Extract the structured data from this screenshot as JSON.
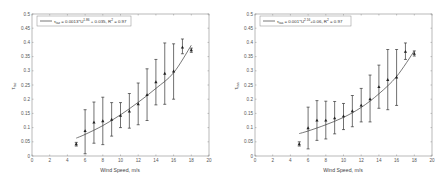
{
  "chart_data": [
    {
      "type": "scatter",
      "panel": "left",
      "title": "",
      "xlabel": "Wind Speed, m/s",
      "ylabel": "τ_taz",
      "xlim": [
        0,
        20
      ],
      "ylim": [
        0,
        0.5
      ],
      "xticks": [
        0,
        2,
        4,
        6,
        8,
        10,
        12,
        14,
        16,
        18,
        20
      ],
      "yticks": [
        0,
        0.05,
        0.1,
        0.15,
        0.2,
        0.25,
        0.3,
        0.35,
        0.4,
        0.45,
        0.5
      ],
      "xtick_labels": [
        "0",
        "2",
        "4",
        "6",
        "8",
        "10",
        "12",
        "14",
        "16",
        "18",
        "20"
      ],
      "ytick_labels": [
        "0",
        "0.05",
        "0.1",
        "0.15",
        "0.2",
        "0.25",
        "0.3",
        "0.35",
        "0.4",
        "0.45",
        "0.5"
      ],
      "grid": false,
      "legend": {
        "position": "upper left",
        "entries": [
          "τ_taz = 0.0013*U^1.86 + 0.035, R² = 0.97"
        ]
      },
      "series": [
        {
          "name": "observed (mean ± std)",
          "marker": "triangle",
          "x": [
            5,
            6,
            7,
            8,
            9,
            10,
            11,
            12,
            13,
            14,
            15,
            16,
            17,
            18
          ],
          "y": [
            0.042,
            0.088,
            0.118,
            0.123,
            0.128,
            0.142,
            0.157,
            0.183,
            0.215,
            0.26,
            0.29,
            0.298,
            0.382,
            0.373
          ],
          "err_low": [
            0.035,
            0.008,
            0.045,
            0.04,
            0.07,
            0.1,
            0.098,
            0.11,
            0.125,
            0.18,
            0.182,
            0.2,
            0.36,
            0.365
          ],
          "err_high": [
            0.048,
            0.163,
            0.19,
            0.207,
            0.188,
            0.188,
            0.22,
            0.257,
            0.307,
            0.34,
            0.398,
            0.395,
            0.412,
            0.38
          ]
        },
        {
          "name": "fit",
          "type": "line",
          "x": [
            5,
            6,
            8,
            10,
            12,
            14,
            16,
            18
          ],
          "y": [
            0.063,
            0.076,
            0.107,
            0.145,
            0.189,
            0.238,
            0.293,
            0.39
          ]
        }
      ]
    },
    {
      "type": "scatter",
      "panel": "right",
      "title": "",
      "xlabel": "Wind Speed, m/s",
      "ylabel": "τ_taa",
      "xlim": [
        0,
        20
      ],
      "ylim": [
        0,
        0.5
      ],
      "xticks": [
        0,
        2,
        4,
        6,
        8,
        10,
        12,
        14,
        16,
        18,
        20
      ],
      "yticks": [
        0,
        0.05,
        0.1,
        0.15,
        0.2,
        0.25,
        0.3,
        0.35,
        0.4,
        0.45,
        0.5
      ],
      "xtick_labels": [
        "0",
        "2",
        "4",
        "6",
        "8",
        "10",
        "12",
        "14",
        "16",
        "18",
        "20"
      ],
      "ytick_labels": [
        "0",
        "0.05",
        "0.1",
        "0.15",
        "0.2",
        "0.25",
        "0.3",
        "0.35",
        "0.4",
        "0.45",
        "0.5"
      ],
      "grid": false,
      "legend": {
        "position": "upper left",
        "entries": [
          "τ_taa = 0.001*U^2.16 + 0.06, R² = 0.97"
        ]
      },
      "series": [
        {
          "name": "observed (mean ± std)",
          "marker": "triangle",
          "x": [
            5,
            6,
            7,
            8,
            9,
            10,
            11,
            12,
            13,
            14,
            15,
            16,
            17,
            18
          ],
          "y": [
            0.042,
            0.098,
            0.125,
            0.125,
            0.133,
            0.14,
            0.158,
            0.178,
            0.2,
            0.243,
            0.268,
            0.277,
            0.367,
            0.36
          ],
          "err_low": [
            0.035,
            0.025,
            0.055,
            0.06,
            0.078,
            0.093,
            0.103,
            0.12,
            0.12,
            0.168,
            0.163,
            0.178,
            0.34,
            0.352
          ],
          "err_high": [
            0.05,
            0.172,
            0.195,
            0.193,
            0.192,
            0.185,
            0.213,
            0.238,
            0.285,
            0.32,
            0.375,
            0.375,
            0.398,
            0.37
          ]
        },
        {
          "name": "fit",
          "type": "line",
          "x": [
            5,
            6,
            8,
            10,
            12,
            14,
            16,
            18
          ],
          "y": [
            0.079,
            0.088,
            0.11,
            0.136,
            0.171,
            0.219,
            0.28,
            0.37
          ]
        }
      ]
    }
  ],
  "panels": {
    "left": {
      "xlabel": "Wind Speed, m/s",
      "ylabel_main": "τ",
      "ylabel_sub": "taz",
      "legend_sub": "taz",
      "legend_eq_a": " = 0.0013*U",
      "legend_exp": "1.86",
      "legend_eq_b": " + 0.035, R",
      "legend_r2": "2",
      "legend_eq_c": " = 0.97"
    },
    "right": {
      "xlabel": "Wind Speed, m/s",
      "ylabel_main": "τ",
      "ylabel_sub": "taa",
      "legend_sub": "taa",
      "legend_eq_a": " = 0.001*U",
      "legend_exp": "2.16",
      "legend_eq_b": "+0.06, R",
      "legend_r2": "2",
      "legend_eq_c": " = 0.97"
    }
  },
  "colors": {
    "axis": "#8a8a8a",
    "marker": "#222222",
    "errorbar": "#333333",
    "fit_line": "#555555",
    "text": "#555555"
  }
}
